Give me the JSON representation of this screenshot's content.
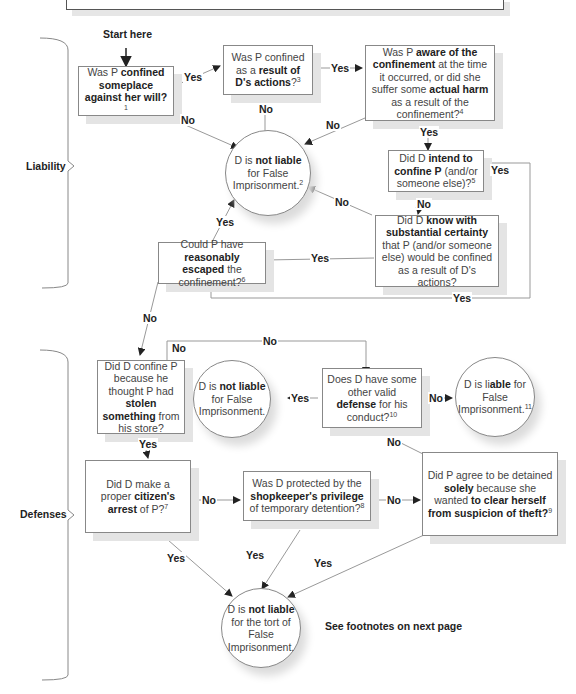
{
  "start_label": "Start here",
  "sections": {
    "liability": "Liability",
    "defenses": "Defenses"
  },
  "nodes": {
    "q1": {
      "pre": "Was P ",
      "bold": "confined someplace against her will?",
      "post": "",
      "fn": "1"
    },
    "q2": {
      "pre": "Was P confined as a ",
      "bold": "result of D's actions",
      "post": "?",
      "fn": "3"
    },
    "q3": {
      "pre": "Was P ",
      "bold": "aware of the confinement",
      "mid": " at the time it occurred, or did she suffer some ",
      "bold2": "actual harm",
      "post": " as a result of the confinement?",
      "fn": "4"
    },
    "not_liable_1": {
      "pre": "D is ",
      "bold": "not liable",
      "post": " for False Imprisonment.",
      "fn": "2"
    },
    "q4": {
      "pre": "Did D ",
      "bold": "intend to confine P",
      "post": " (and/or someone else)?",
      "fn": "5"
    },
    "q5": {
      "pre": "Did D ",
      "bold": "know with substantial certainty",
      "post": " that P (and/or someone else) would be confined as a result of D's actions?",
      "fn": ""
    },
    "q6": {
      "pre": "Could P have ",
      "bold": "reasonably escaped",
      "post": " the confinement?",
      "fn": "6"
    },
    "q7": {
      "pre": "Did D confine P because he thought P had ",
      "bold": "stolen something",
      "post": " from his store?",
      "fn": ""
    },
    "not_liable_2": {
      "pre": "D is ",
      "bold": "not liable",
      "post": " for False Imprisonment.",
      "fn": ""
    },
    "q8": {
      "pre": "Does D have some other valid ",
      "bold": "defense",
      "post": " for his conduct?",
      "fn": "10"
    },
    "liable": {
      "pre": "D is li",
      "bold": "able",
      "post": " for False Imprisonment.",
      "fn": "11"
    },
    "q9": {
      "pre": "Did D make a proper ",
      "bold": "citizen's arrest",
      "post": " of P?",
      "fn": "7"
    },
    "q10": {
      "pre": "Was D protected by the ",
      "bold": "shopkeeper's privilege",
      "post": " of temporary detention?",
      "fn": "8"
    },
    "q11": {
      "pre": "Did P agree to be detained ",
      "bold": "solely",
      "mid": " because she wanted ",
      "bold2": "to clear herself from suspicion of theft?",
      "post": "",
      "fn": "9"
    },
    "not_liable_3": {
      "pre": "D is ",
      "bold": "not liable",
      "post": " for the tort of False Imprisonment.",
      "fn": ""
    }
  },
  "edge_labels": {
    "yes": "Yes",
    "no": "No"
  },
  "footnote_note": "See footnotes on next page"
}
